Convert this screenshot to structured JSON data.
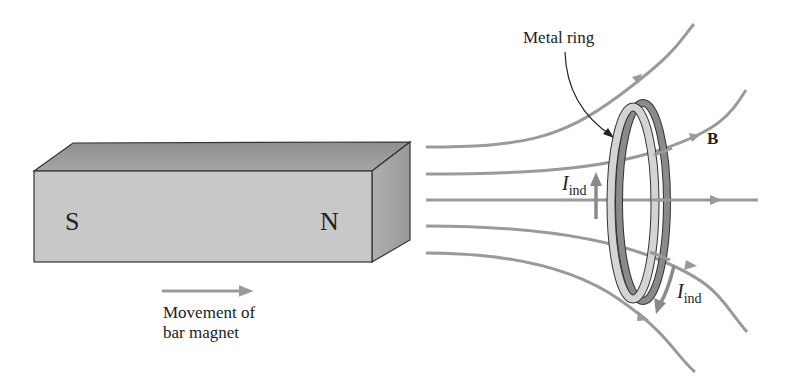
{
  "diagram": {
    "magnet": {
      "south_label": "S",
      "north_label": "N",
      "front_color": "#c8c8c8",
      "top_color": "#9a9a9a",
      "side_color": "#a8a8a8"
    },
    "movement": {
      "line1": "Movement of",
      "line2": "bar magnet"
    },
    "ring": {
      "label": "Metal ring",
      "front_color": "#d4d4d4",
      "back_color": "#8a8a8a"
    },
    "field": {
      "label": "B",
      "line_color": "#9a9a9a"
    },
    "induced_current": {
      "symbol": "I",
      "subscript": "ind",
      "arrow_color": "#8a8a8a"
    }
  }
}
